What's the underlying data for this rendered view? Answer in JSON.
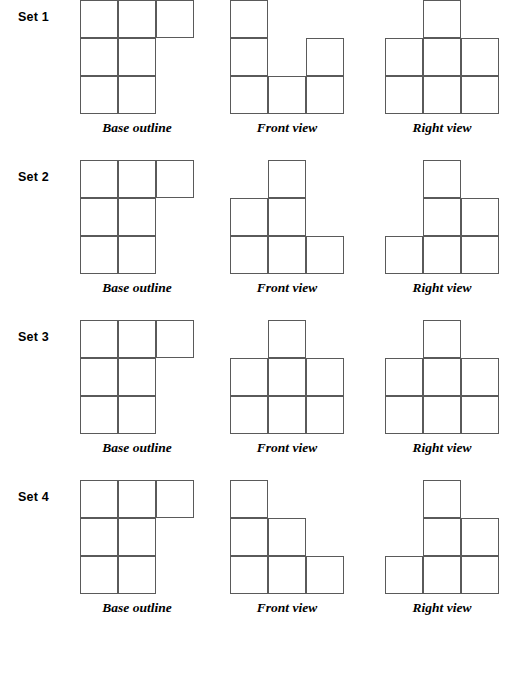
{
  "worksheet": {
    "grid_columns": 3,
    "grid_rows": 3,
    "column_captions": {
      "base": "Base outline",
      "front": "Front view",
      "right": "Right view"
    },
    "sets": [
      {
        "label": "Set 1",
        "figures": [
          {
            "view": "base",
            "caption": "Base outline",
            "cells": [
              [
                1,
                1,
                1
              ],
              [
                1,
                1,
                0
              ],
              [
                1,
                1,
                0
              ]
            ]
          },
          {
            "view": "front",
            "caption": "Front view",
            "cells": [
              [
                1,
                0,
                0
              ],
              [
                1,
                0,
                1
              ],
              [
                1,
                1,
                1
              ]
            ]
          },
          {
            "view": "right",
            "caption": "Right view",
            "cells": [
              [
                0,
                1,
                0
              ],
              [
                1,
                1,
                1
              ],
              [
                1,
                1,
                1
              ]
            ]
          }
        ]
      },
      {
        "label": "Set 2",
        "figures": [
          {
            "view": "base",
            "caption": "Base outline",
            "cells": [
              [
                1,
                1,
                1
              ],
              [
                1,
                1,
                0
              ],
              [
                1,
                1,
                0
              ]
            ]
          },
          {
            "view": "front",
            "caption": "Front view",
            "cells": [
              [
                0,
                1,
                0
              ],
              [
                1,
                1,
                0
              ],
              [
                1,
                1,
                1
              ]
            ]
          },
          {
            "view": "right",
            "caption": "Right view",
            "cells": [
              [
                0,
                1,
                0
              ],
              [
                0,
                1,
                1
              ],
              [
                1,
                1,
                1
              ]
            ]
          }
        ]
      },
      {
        "label": "Set 3",
        "figures": [
          {
            "view": "base",
            "caption": "Base outline",
            "cells": [
              [
                1,
                1,
                1
              ],
              [
                1,
                1,
                0
              ],
              [
                1,
                1,
                0
              ]
            ]
          },
          {
            "view": "front",
            "caption": "Front view",
            "cells": [
              [
                0,
                1,
                0
              ],
              [
                1,
                1,
                1
              ],
              [
                1,
                1,
                1
              ]
            ]
          },
          {
            "view": "right",
            "caption": "Right view",
            "cells": [
              [
                0,
                1,
                0
              ],
              [
                1,
                1,
                1
              ],
              [
                1,
                1,
                1
              ]
            ]
          }
        ]
      },
      {
        "label": "Set 4",
        "figures": [
          {
            "view": "base",
            "caption": "Base outline",
            "cells": [
              [
                1,
                1,
                1
              ],
              [
                1,
                1,
                0
              ],
              [
                1,
                1,
                0
              ]
            ]
          },
          {
            "view": "front",
            "caption": "Front view",
            "cells": [
              [
                1,
                0,
                0
              ],
              [
                1,
                1,
                0
              ],
              [
                1,
                1,
                1
              ]
            ]
          },
          {
            "view": "right",
            "caption": "Right view",
            "cells": [
              [
                0,
                1,
                0
              ],
              [
                0,
                1,
                1
              ],
              [
                1,
                1,
                1
              ]
            ]
          }
        ]
      }
    ]
  },
  "style": {
    "line_color": "#5a5a5a",
    "background": "#ffffff",
    "text_color": "#000000"
  }
}
